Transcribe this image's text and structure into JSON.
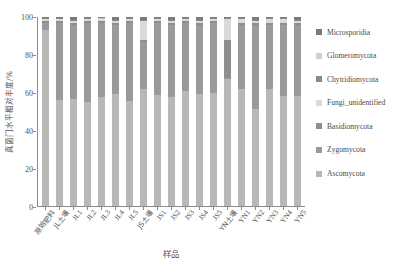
{
  "chart_data": {
    "type": "bar",
    "stacked": true,
    "title": "",
    "xlabel": "样品",
    "ylabel": "真菌门水平相对丰度/%",
    "ylim": [
      0,
      100
    ],
    "yticks": [
      0,
      20,
      40,
      60,
      80,
      100
    ],
    "grid": false,
    "legend_position": "right",
    "categories": [
      "原始肥料",
      "JL土壤",
      "JL1",
      "JL2",
      "JL3",
      "JL4",
      "JL5",
      "JS土壤",
      "JS1",
      "JS2",
      "JS3",
      "JS4",
      "JS5",
      "YN土壤",
      "YN1",
      "YN2",
      "YN3",
      "YN4",
      "YN5"
    ],
    "series": [
      {
        "name": "Ascomycota",
        "color": "#b8b8b8",
        "values": [
          93,
          56,
          57,
          55,
          58,
          60,
          56,
          62,
          59,
          58,
          61,
          60,
          60,
          67,
          62,
          52,
          62,
          58,
          59
        ]
      },
      {
        "name": "Zygomycota",
        "color": "#9a9a9a",
        "values": [
          4,
          41,
          40,
          42,
          39,
          37,
          42,
          25,
          38,
          39,
          36,
          37,
          37,
          1,
          34,
          45,
          34,
          38,
          38
        ]
      },
      {
        "name": "Basidiomycota",
        "color": "#8e8e8e",
        "values": [
          1,
          1,
          1,
          1,
          1,
          1,
          1,
          1,
          1,
          1,
          1,
          1,
          1,
          20,
          1,
          1,
          1,
          1,
          1
        ]
      },
      {
        "name": "Fungi_unidentified",
        "color": "#dadada",
        "values": [
          1,
          1,
          1,
          1,
          1,
          1,
          1,
          10,
          1,
          1,
          1,
          1,
          1,
          11,
          2,
          1,
          2,
          2,
          1
        ]
      },
      {
        "name": "Chytridiomycota",
        "color": "#8a8a8a",
        "values": [
          0.4,
          0.4,
          0.4,
          0.4,
          0.4,
          0.4,
          0.4,
          0.4,
          0.4,
          0.4,
          0.4,
          0.4,
          0.4,
          0.4,
          0.4,
          0.4,
          0.4,
          0.4,
          0.4
        ]
      },
      {
        "name": "Glomeromycota",
        "color": "#cfcfcf",
        "values": [
          0.3,
          0.3,
          0.3,
          0.3,
          0.3,
          0.3,
          0.3,
          0.3,
          0.3,
          0.3,
          0.3,
          0.3,
          0.3,
          0.3,
          0.3,
          0.3,
          0.3,
          0.3,
          0.3
        ]
      },
      {
        "name": "Microsporidia",
        "color": "#7b7b7b",
        "values": [
          0.3,
          0.3,
          1.3,
          0.3,
          0.6,
          1.3,
          0.3,
          1.3,
          0.3,
          1.3,
          0.3,
          1.3,
          0.3,
          0.3,
          0.3,
          1.3,
          0.3,
          0.3,
          1.3
        ]
      }
    ]
  },
  "legend": {
    "items": [
      {
        "label": "Microsporidia",
        "color": "#7b7b7b"
      },
      {
        "label": "Glomeromycota",
        "color": "#cfcfcf"
      },
      {
        "label": "Chytridiomycota",
        "color": "#8a8a8a"
      },
      {
        "label": "Fungi_unidentified",
        "color": "#dadada"
      },
      {
        "label": "Basidiomycota",
        "color": "#8e8e8e"
      },
      {
        "label": "Zygomycota",
        "color": "#9a9a9a"
      },
      {
        "label": "Ascomycota",
        "color": "#b8b8b8"
      }
    ]
  },
  "axes": {
    "y_title": "真菌门水平相对丰度/%",
    "x_title": "样品",
    "y_tick_labels": [
      "100",
      "80",
      "60",
      "40",
      "20",
      "0"
    ]
  }
}
